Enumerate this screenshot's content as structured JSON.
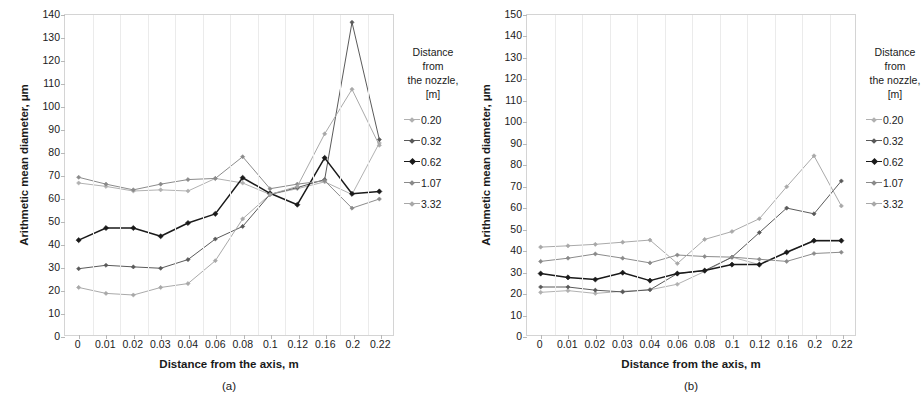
{
  "figure": {
    "panels": [
      {
        "caption": "(a)",
        "xlabel": "Distance from the axis, m",
        "ylabel": "Arithmetic mean diameter, μm"
      },
      {
        "caption": "(b)",
        "xlabel": "Distance from the axis, m",
        "ylabel": "Arithmetic mean diameter, μm"
      }
    ]
  },
  "legend": {
    "title_lines": [
      "Distance",
      "from",
      "the nozzle,",
      "[m]"
    ],
    "items": [
      {
        "label": "0.20",
        "color": "#b0b0b0"
      },
      {
        "label": "0.32",
        "color": "#595959"
      },
      {
        "label": "0.62",
        "color": "#1a1a1a"
      },
      {
        "label": "1.07",
        "color": "#8a8a8a"
      },
      {
        "label": "3.32",
        "color": "#a8a8a8"
      }
    ]
  },
  "chart_data": [
    {
      "type": "line",
      "title": "(a)",
      "xlabel": "Distance from the axis, m",
      "ylabel": "Arithmetic mean diameter, μm",
      "legend_title": "Distance from the nozzle, [m]",
      "legend_position": "right",
      "grid": true,
      "categories": [
        "0",
        "0.01",
        "0.02",
        "0.03",
        "0.04",
        "0.06",
        "0.08",
        "0.1",
        "0.12",
        "0.16",
        "0.2",
        "0.22"
      ],
      "ylim": [
        0,
        140
      ],
      "ytick_step": 10,
      "yticks": [
        0,
        10,
        20,
        30,
        40,
        50,
        60,
        70,
        80,
        90,
        100,
        110,
        120,
        130,
        140
      ],
      "series": [
        {
          "name": "0.20",
          "color": "#b0b0b0",
          "values": [
            66.5,
            65.0,
            63.0,
            63.5,
            63.0,
            68.5,
            66.5,
            61.5,
            64.0,
            67.0,
            61.5,
            84.0
          ]
        },
        {
          "name": "0.32",
          "color": "#595959",
          "values": [
            29.0,
            30.5,
            29.8,
            29.2,
            33.0,
            42.0,
            47.5,
            61.5,
            64.5,
            68.0,
            136.8,
            85.5
          ]
        },
        {
          "name": "0.62",
          "color": "#1a1a1a",
          "values": [
            41.5,
            46.8,
            46.8,
            43.2,
            49.0,
            53.0,
            68.8,
            62.0,
            57.0,
            77.5,
            61.8,
            62.8
          ]
        },
        {
          "name": "1.07",
          "color": "#8a8a8a",
          "values": [
            69.0,
            66.0,
            63.5,
            66.0,
            68.0,
            68.5,
            78.0,
            64.0,
            66.0,
            67.5,
            55.5,
            59.5
          ]
        },
        {
          "name": "3.32",
          "color": "#a8a8a8",
          "values": [
            20.8,
            18.2,
            17.5,
            20.8,
            22.5,
            32.5,
            50.8,
            61.5,
            65.0,
            88.0,
            107.5,
            83.0
          ]
        }
      ]
    },
    {
      "type": "line",
      "title": "(b)",
      "xlabel": "Distance from the axis, m",
      "ylabel": "Arithmetic mean diameter, μm",
      "legend_title": "Distance from the nozzle, [m]",
      "legend_position": "right",
      "grid": true,
      "categories": [
        "0",
        "0.01",
        "0.02",
        "0.03",
        "0.04",
        "0.06",
        "0.08",
        "0.1",
        "0.12",
        "0.16",
        "0.2",
        "0.22"
      ],
      "ylim": [
        0,
        150
      ],
      "ytick_step": 10,
      "yticks": [
        0,
        10,
        20,
        30,
        40,
        50,
        60,
        70,
        80,
        90,
        100,
        110,
        120,
        130,
        140,
        150
      ],
      "series": [
        {
          "name": "0.20",
          "color": "#b0b0b0",
          "values": [
            20.0,
            20.8,
            19.5,
            20.5,
            21.2,
            23.8,
            29.8,
            36.5,
            33.0,
            38.5,
            44.5,
            44.5
          ]
        },
        {
          "name": "0.32",
          "color": "#595959",
          "values": [
            22.5,
            22.5,
            21.0,
            20.2,
            21.2,
            28.8,
            30.2,
            36.5,
            48.0,
            59.5,
            56.8,
            72.2
          ]
        },
        {
          "name": "0.62",
          "color": "#1a1a1a",
          "values": [
            28.8,
            27.0,
            26.0,
            29.2,
            25.5,
            28.8,
            30.2,
            33.0,
            33.0,
            38.8,
            44.2,
            44.2
          ]
        },
        {
          "name": "1.07",
          "color": "#8a8a8a",
          "values": [
            34.5,
            36.0,
            38.0,
            36.0,
            33.8,
            37.5,
            36.8,
            36.5,
            35.5,
            34.5,
            38.2,
            38.8
          ]
        },
        {
          "name": "3.32",
          "color": "#a8a8a8",
          "values": [
            41.2,
            41.8,
            42.5,
            43.5,
            44.5,
            33.5,
            44.8,
            48.5,
            54.5,
            69.5,
            84.0,
            60.5
          ]
        }
      ]
    }
  ]
}
